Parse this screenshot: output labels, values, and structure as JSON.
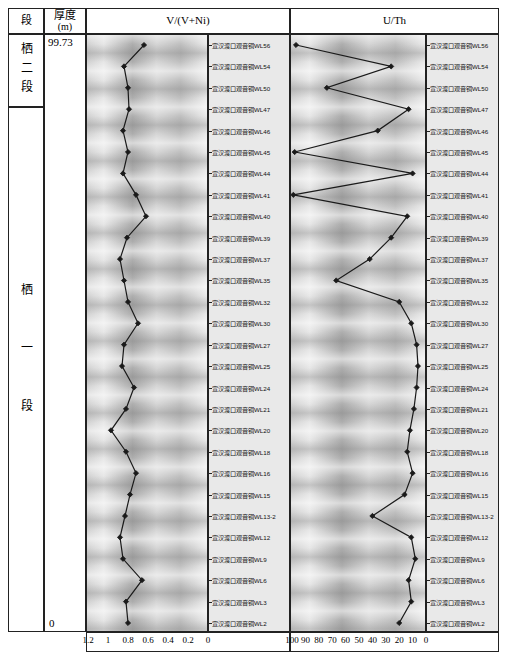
{
  "table": {
    "col_section_header": "段",
    "col_thickness_header": "厚度",
    "col_thickness_unit": "(m)",
    "section_upper": "栖二段",
    "section_lower": "栖一段",
    "thickness_top": "99.73",
    "thickness_bottom": "0"
  },
  "chart_data": [
    {
      "type": "line",
      "title": "V/(V+Ni)",
      "orientation": "vertical-log",
      "xlabel": "V/(V+Ni)",
      "ylabel": "",
      "axis_reversed": true,
      "xlim": [
        1.2,
        0
      ],
      "grid": false,
      "tick_labels": [
        "1.2",
        "1",
        "0.8",
        "0.6",
        "0.4",
        "0.2",
        "0"
      ],
      "tick_values": [
        1.2,
        1.0,
        0.8,
        0.6,
        0.4,
        0.2,
        0
      ],
      "categories": [
        "WL56",
        "WL54",
        "WL50",
        "WL47",
        "WL46",
        "WL45",
        "WL44",
        "WL41",
        "WL40",
        "WL39",
        "WL37",
        "WL35",
        "WL32",
        "WL30",
        "WL27",
        "WL25",
        "WL24",
        "WL21",
        "WL20",
        "WL18",
        "WL16",
        "WL15",
        "WL13-2",
        "WL12",
        "WL9",
        "WL6",
        "WL3",
        "WL2"
      ],
      "values": [
        0.64,
        0.84,
        0.8,
        0.79,
        0.85,
        0.8,
        0.85,
        0.72,
        0.62,
        0.81,
        0.88,
        0.84,
        0.8,
        0.7,
        0.84,
        0.86,
        0.74,
        0.82,
        0.97,
        0.82,
        0.72,
        0.78,
        0.83,
        0.88,
        0.85,
        0.66,
        0.82,
        0.8
      ]
    },
    {
      "type": "line",
      "title": "U/Th",
      "orientation": "vertical-log",
      "xlabel": "U/Th",
      "ylabel": "",
      "axis_reversed": true,
      "xlim": [
        100,
        0
      ],
      "grid": false,
      "tick_labels": [
        "100",
        "90",
        "80",
        "70",
        "60",
        "50",
        "40",
        "30",
        "20",
        "10",
        "0"
      ],
      "tick_values": [
        100,
        90,
        80,
        70,
        60,
        50,
        40,
        30,
        20,
        10,
        0
      ],
      "categories": [
        "WL56",
        "WL54",
        "WL50",
        "WL47",
        "WL46",
        "WL45",
        "WL44",
        "WL41",
        "WL40",
        "WL39",
        "WL37",
        "WL35",
        "WL32",
        "WL30",
        "WL27",
        "WL25",
        "WL24",
        "WL21",
        "WL20",
        "WL18",
        "WL16",
        "WL15",
        "WL13-2",
        "WL12",
        "WL9",
        "WL6",
        "WL3",
        "WL2"
      ],
      "values": [
        97,
        26,
        74,
        13,
        36,
        98,
        10,
        99,
        14,
        26,
        42,
        67,
        20,
        11,
        7,
        6,
        7,
        9,
        12,
        14,
        10,
        16,
        40,
        11,
        8,
        13,
        11,
        20
      ]
    }
  ],
  "samples": {
    "prefix": "宣汉渡口观音铜",
    "ids": [
      "WL56",
      "WL54",
      "WL50",
      "WL47",
      "WL46",
      "WL45",
      "WL44",
      "WL41",
      "WL40",
      "WL39",
      "WL37",
      "WL35",
      "WL32",
      "WL30",
      "WL27",
      "WL25",
      "WL24",
      "WL21",
      "WL20",
      "WL18",
      "WL16",
      "WL15",
      "WL13-2",
      "WL12",
      "WL9",
      "WL6",
      "WL3",
      "WL2"
    ]
  }
}
